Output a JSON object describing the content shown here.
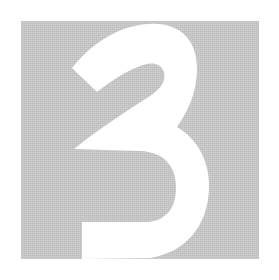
{
  "tile": {
    "digit": "3",
    "background_color": "#c9c9c9",
    "glyph_color": "#ffffff"
  }
}
